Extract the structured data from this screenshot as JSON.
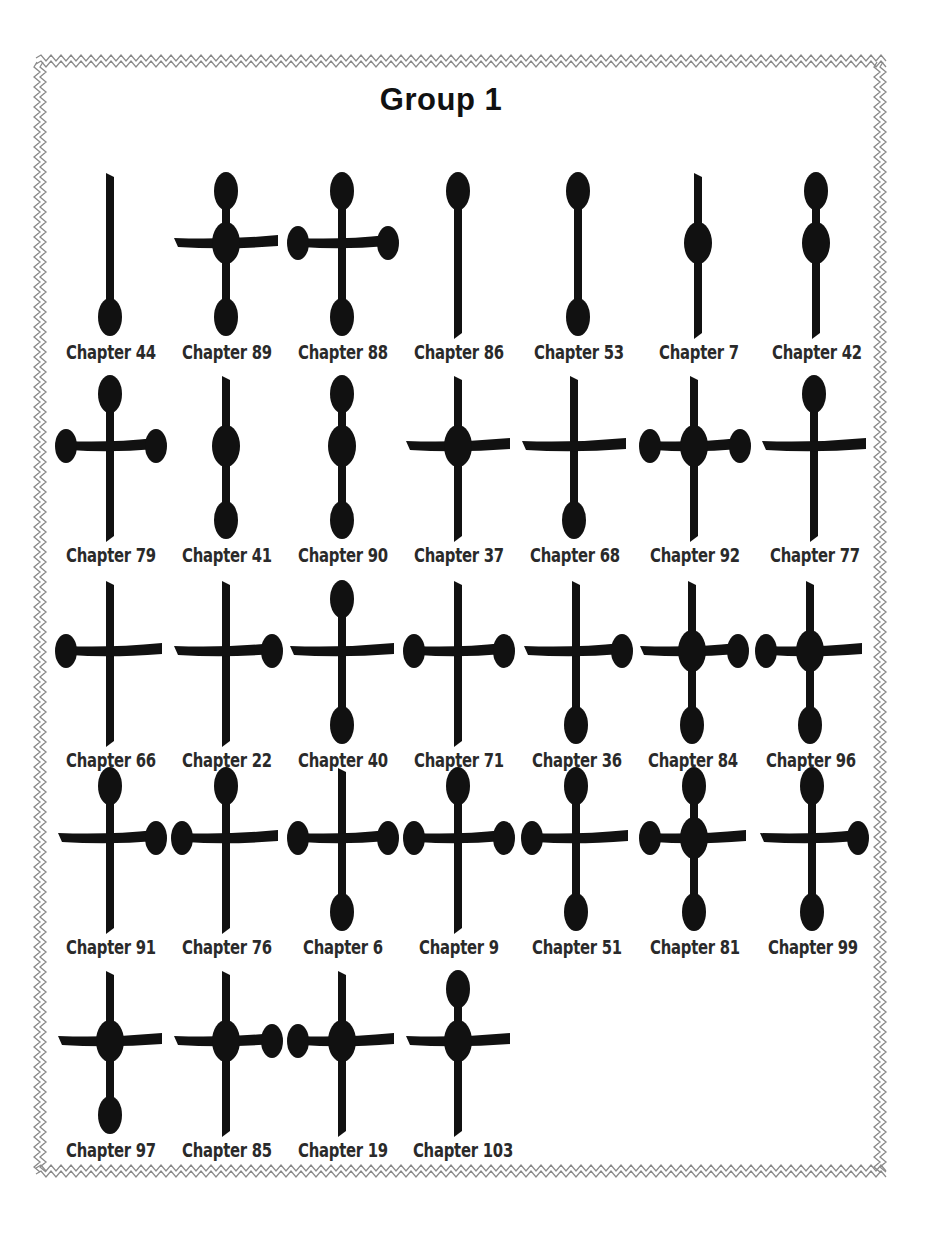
{
  "page": {
    "title": "Group 1",
    "colors": {
      "glyph": "#111111",
      "label": "#2a2a2a",
      "border": "#8a8a8a",
      "background": "#ffffff"
    }
  },
  "glyph_legend": {
    "stroke": "vertical stem with optional horizontal crossbar",
    "dots": "T = top dot, B = bottom dot, L = left dot, R = right dot, C = center dot",
    "bar": "none | full | left-tail | right-tail"
  },
  "rows": [
    {
      "y": 165,
      "items": [
        {
          "label": "Chapter 44",
          "x": 52,
          "bar": "none",
          "dots": [
            "B"
          ]
        },
        {
          "label": "Chapter 89",
          "x": 168,
          "bar": "full",
          "dots": [
            "T",
            "C",
            "B"
          ]
        },
        {
          "label": "Chapter 88",
          "x": 284,
          "bar": "full",
          "dots": [
            "T",
            "L",
            "R",
            "B"
          ]
        },
        {
          "label": "Chapter 86",
          "x": 400,
          "bar": "none",
          "dots": [
            "T"
          ]
        },
        {
          "label": "Chapter 53",
          "x": 520,
          "bar": "none",
          "dots": [
            "T",
            "B"
          ]
        },
        {
          "label": "Chapter 7",
          "x": 640,
          "bar": "none",
          "dots": [
            "C"
          ]
        },
        {
          "label": "Chapter 42",
          "x": 758,
          "bar": "none",
          "dots": [
            "T",
            "C"
          ]
        }
      ]
    },
    {
      "y": 368,
      "items": [
        {
          "label": "Chapter 79",
          "x": 52,
          "bar": "full",
          "dots": [
            "T",
            "L",
            "R"
          ]
        },
        {
          "label": "Chapter 41",
          "x": 168,
          "bar": "none",
          "dots": [
            "C",
            "B"
          ]
        },
        {
          "label": "Chapter 90",
          "x": 284,
          "bar": "none",
          "dots": [
            "T",
            "C",
            "B"
          ]
        },
        {
          "label": "Chapter 37",
          "x": 400,
          "bar": "full",
          "dots": [
            "C"
          ]
        },
        {
          "label": "Chapter 68",
          "x": 516,
          "bar": "full",
          "dots": [
            "B"
          ]
        },
        {
          "label": "Chapter 92",
          "x": 636,
          "bar": "full",
          "dots": [
            "L",
            "C",
            "R"
          ]
        },
        {
          "label": "Chapter 77",
          "x": 756,
          "bar": "full",
          "dots": [
            "T"
          ]
        }
      ]
    },
    {
      "y": 573,
      "items": [
        {
          "label": "Chapter 66",
          "x": 52,
          "bar": "full",
          "dots": [
            "L"
          ]
        },
        {
          "label": "Chapter 22",
          "x": 168,
          "bar": "full",
          "dots": [
            "R"
          ]
        },
        {
          "label": "Chapter 40",
          "x": 284,
          "bar": "full",
          "dots": [
            "T",
            "B"
          ]
        },
        {
          "label": "Chapter 71",
          "x": 400,
          "bar": "full",
          "dots": [
            "L",
            "R"
          ]
        },
        {
          "label": "Chapter 36",
          "x": 518,
          "bar": "full",
          "dots": [
            "R",
            "B"
          ]
        },
        {
          "label": "Chapter 84",
          "x": 634,
          "bar": "full",
          "dots": [
            "C",
            "R",
            "B"
          ]
        },
        {
          "label": "Chapter 96",
          "x": 752,
          "bar": "full",
          "dots": [
            "L",
            "C",
            "B"
          ]
        }
      ]
    },
    {
      "y": 760,
      "items": [
        {
          "label": "Chapter 91",
          "x": 52,
          "bar": "full",
          "dots": [
            "T",
            "R"
          ]
        },
        {
          "label": "Chapter 76",
          "x": 168,
          "bar": "full",
          "dots": [
            "T",
            "L"
          ]
        },
        {
          "label": "Chapter 6",
          "x": 284,
          "bar": "full",
          "dots": [
            "L",
            "R",
            "B"
          ]
        },
        {
          "label": "Chapter 9",
          "x": 400,
          "bar": "full",
          "dots": [
            "T",
            "L",
            "R"
          ]
        },
        {
          "label": "Chapter 51",
          "x": 518,
          "bar": "full",
          "dots": [
            "T",
            "L",
            "B"
          ]
        },
        {
          "label": "Chapter 81",
          "x": 636,
          "bar": "full",
          "dots": [
            "T",
            "L",
            "C",
            "B"
          ]
        },
        {
          "label": "Chapter 99",
          "x": 754,
          "bar": "full",
          "dots": [
            "T",
            "R",
            "B"
          ]
        }
      ]
    },
    {
      "y": 963,
      "items": [
        {
          "label": "Chapter 97",
          "x": 52,
          "bar": "full",
          "dots": [
            "C",
            "B"
          ]
        },
        {
          "label": "Chapter 85",
          "x": 168,
          "bar": "full",
          "dots": [
            "C",
            "R"
          ]
        },
        {
          "label": "Chapter 19",
          "x": 284,
          "bar": "full",
          "dots": [
            "L",
            "C"
          ]
        },
        {
          "label": "Chapter 103",
          "x": 400,
          "bar": "full",
          "dots": [
            "T",
            "C"
          ]
        }
      ]
    }
  ]
}
